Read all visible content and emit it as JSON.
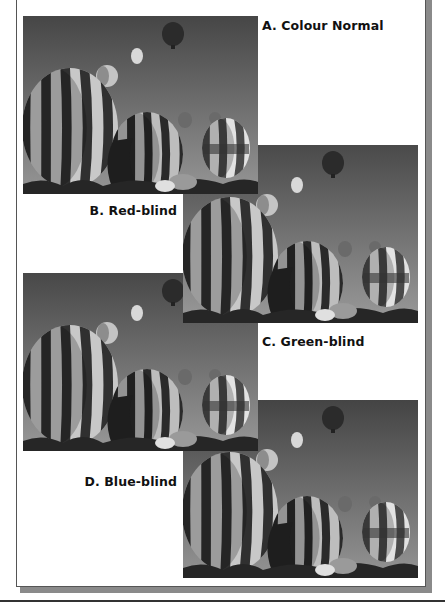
{
  "figure": {
    "panels": [
      {
        "id": "a",
        "label": "A. Colour Normal",
        "image": "hot-air-balloons-photo",
        "tone": "normal"
      },
      {
        "id": "b",
        "label": "B. Red-blind",
        "image": "hot-air-balloons-photo",
        "tone": "red-blind"
      },
      {
        "id": "c",
        "label": "C. Green-blind",
        "image": "hot-air-balloons-photo",
        "tone": "green-blind"
      },
      {
        "id": "d",
        "label": "D. Blue-blind",
        "image": "hot-air-balloons-photo",
        "tone": "blue-blind"
      }
    ]
  },
  "colors": {
    "frame_border": "#555555",
    "frame_shadow": "#8a8a8a",
    "label_text": "#111111"
  }
}
